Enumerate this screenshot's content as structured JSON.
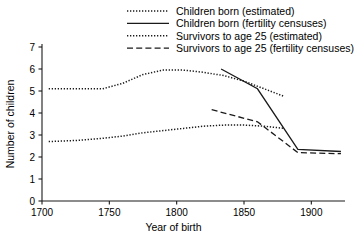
{
  "chart_data": {
    "type": "line",
    "title": "",
    "xlabel": "Year of birth",
    "ylabel": "Number of children",
    "xlim": [
      1700,
      1925
    ],
    "ylim": [
      0,
      7
    ],
    "xticks": [
      1700,
      1750,
      1800,
      1850,
      1900
    ],
    "yticks": [
      0,
      1,
      2,
      3,
      4,
      5,
      6,
      7
    ],
    "xtick_labels": [
      "1700",
      "1750",
      "1800",
      "1850",
      "1900"
    ],
    "ytick_labels": [
      "0",
      "1",
      "2",
      "3",
      "4",
      "5",
      "6",
      "7"
    ],
    "grid": false,
    "legend_position": "top",
    "series": [
      {
        "name": "Children born (estimated)",
        "style": "dotted",
        "color": "#1a1a1a",
        "x": [
          1705,
          1725,
          1745,
          1760,
          1775,
          1790,
          1805,
          1820,
          1835,
          1850,
          1865,
          1880
        ],
        "values": [
          5.1,
          5.1,
          5.1,
          5.35,
          5.75,
          5.95,
          5.95,
          5.85,
          5.7,
          5.45,
          5.1,
          4.75
        ]
      },
      {
        "name": "Children born (fertility censuses)",
        "style": "solid",
        "color": "#1a1a1a",
        "x": [
          1833,
          1860,
          1890,
          1922
        ],
        "values": [
          6.0,
          5.1,
          2.35,
          2.25
        ]
      },
      {
        "name": "Survivors to age 25 (estimated)",
        "style": "dotted",
        "color": "#1a1a1a",
        "x": [
          1705,
          1725,
          1745,
          1760,
          1775,
          1790,
          1805,
          1820,
          1835,
          1850,
          1865,
          1880
        ],
        "values": [
          2.7,
          2.75,
          2.85,
          2.95,
          3.1,
          3.2,
          3.3,
          3.4,
          3.45,
          3.45,
          3.4,
          3.3
        ]
      },
      {
        "name": "Survivors to age 25 (fertility censuses)",
        "style": "dashed",
        "color": "#1a1a1a",
        "x": [
          1826,
          1860,
          1890,
          1922
        ],
        "values": [
          4.15,
          3.6,
          2.2,
          2.15
        ]
      }
    ]
  },
  "legend": {
    "items": [
      {
        "label": "Children born (estimated)",
        "style": "dotted"
      },
      {
        "label": "Children born (fertility censuses)",
        "style": "solid"
      },
      {
        "label": "Survivors to age 25 (estimated)",
        "style": "dotted"
      },
      {
        "label": "Survivors to age 25 (fertility censuses)",
        "style": "dashed"
      }
    ]
  }
}
